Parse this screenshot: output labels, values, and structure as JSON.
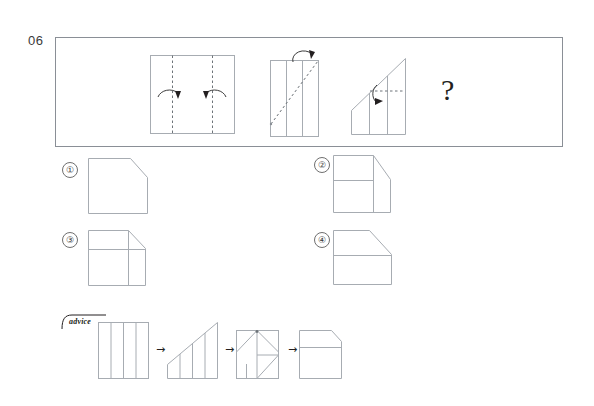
{
  "page": {
    "question_number": "06",
    "question_mark": "?",
    "advice_label": "advice"
  },
  "problem": {
    "panel_border_color": "#8a8f96",
    "stroke_color": "#9aa0a6",
    "fold_color": "#231f20",
    "steps": [
      {
        "index": 1,
        "name": "flat-sheet-with-two-vertical-fold-lines",
        "description": "Rectangle with two vertical dashed fold lines and two curved fold arrows pointing inward",
        "fold_lines": 2,
        "fold_direction": "inward",
        "arrows": 2
      },
      {
        "index": 2,
        "name": "folded-strip-with-diagonal-fold",
        "description": "Narrow folded strip with two vertical crease lines and a dashed diagonal fold line, curved arrow at top",
        "fold_lines": 1,
        "fold_direction": "diagonal",
        "arrows": 1
      },
      {
        "index": 3,
        "name": "triangle-shape-with-horizontal-fold",
        "description": "Right-triangle/wedge shape with vertical creases and a horizontal dashed fold line with a right-pointing arrow",
        "fold_lines": 1,
        "fold_direction": "right",
        "arrows": 1
      },
      {
        "index": 4,
        "name": "unknown-result",
        "description": "Question mark placeholder for the unfolded result"
      }
    ]
  },
  "options": [
    {
      "number": "①",
      "name": "option-1",
      "description": "Square with chamfered top-right corner, no interior lines",
      "interior_lines": 0
    },
    {
      "number": "②",
      "name": "option-2",
      "description": "Square with chamfered top-right corner, one horizontal line in upper half and one vertical line on the right",
      "interior_lines": 2
    },
    {
      "number": "③",
      "name": "option-3",
      "description": "Square with small chamfered top-right corner, divided into a 2x2 grid by one horizontal and one vertical line",
      "interior_lines": 2
    },
    {
      "number": "④",
      "name": "option-4",
      "description": "Square with large chamfered top-right corner and one horizontal dividing line",
      "interior_lines": 1
    }
  ],
  "advice": {
    "label": "advice",
    "arrow": "→",
    "steps": [
      {
        "index": 1,
        "name": "advice-step-flat-sheet",
        "description": "Tall rectangle with three vertical crease lines"
      },
      {
        "index": 2,
        "name": "advice-step-diagonal-cut",
        "description": "Shape with diagonal top edge rising to the right and vertical crease lines"
      },
      {
        "index": 3,
        "name": "advice-step-folded-triangle",
        "description": "Square with triangular folds and diagonal lines inside"
      },
      {
        "index": 4,
        "name": "advice-step-result",
        "description": "Square with chamfered top-right corner and a horizontal dividing line"
      }
    ]
  }
}
